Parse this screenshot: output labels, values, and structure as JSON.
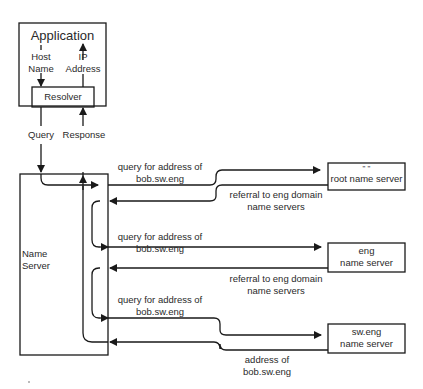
{
  "diagram": {
    "application": {
      "title": "Application",
      "host_name_line1": "Host",
      "host_name_line2": "Name",
      "ip_line1": "IP",
      "ip_line2": "Address",
      "resolver": "Resolver"
    },
    "links": {
      "query": "Query",
      "response": "Response"
    },
    "name_server": {
      "line1": "Name",
      "line2": "Server"
    },
    "root_server": {
      "line1": "\" \"",
      "line2": "root name server"
    },
    "eng_server": {
      "line1": "eng",
      "line2": "name server"
    },
    "sweng_server": {
      "line1": "sw.eng",
      "line2": "name server"
    },
    "messages": [
      {
        "line1": "query for address of",
        "line2": "bob.sw.eng"
      },
      {
        "line1": "referral to eng domain",
        "line2": "name servers"
      },
      {
        "line1": "query for address of",
        "line2": "bob.sw.eng"
      },
      {
        "line1": "referral to eng domain",
        "line2": "name servers"
      },
      {
        "line1": "query for address of",
        "line2": "bob.sw.eng"
      },
      {
        "line1": "address of",
        "line2": "bob.sw.eng"
      }
    ],
    "stroke_color": "#1a1a1a"
  }
}
